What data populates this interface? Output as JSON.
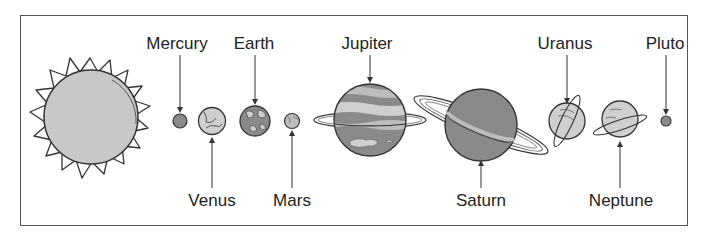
{
  "diagram": {
    "labels": {
      "mercury": "Mercury",
      "venus": "Venus",
      "earth": "Earth",
      "mars": "Mars",
      "jupiter": "Jupiter",
      "saturn": "Saturn",
      "uranus": "Uranus",
      "neptune": "Neptune",
      "pluto": "Pluto"
    },
    "colors": {
      "sun_fill": "#c8c8c8",
      "planet_dark": "#8a8a8a",
      "planet_mid": "#a8a8a8",
      "planet_light": "#cfcfcf",
      "outline": "#333333"
    }
  }
}
